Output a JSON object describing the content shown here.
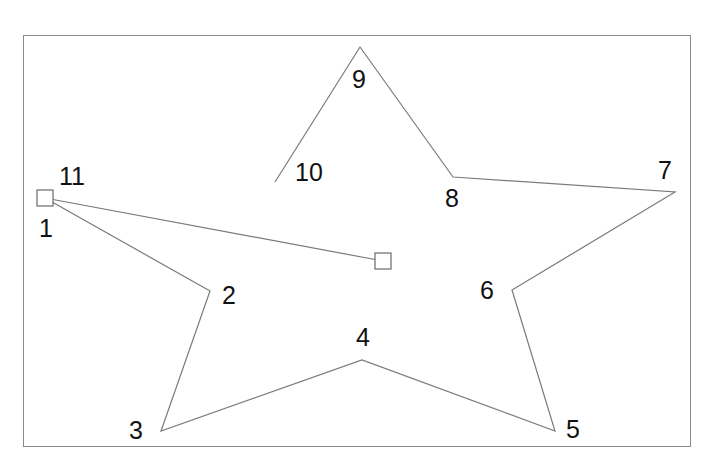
{
  "diagram": {
    "title": "",
    "frame": {
      "x": 23,
      "y": 35,
      "width": 668,
      "height": 412
    },
    "line_color": "#7a7a7a",
    "label_color": "#111111",
    "points": [
      {
        "id": "1",
        "x": 45,
        "y": 198
      },
      {
        "id": "2",
        "x": 210,
        "y": 291
      },
      {
        "id": "3",
        "x": 161,
        "y": 431
      },
      {
        "id": "4",
        "x": 362,
        "y": 360
      },
      {
        "id": "5",
        "x": 555,
        "y": 431
      },
      {
        "id": "6",
        "x": 512,
        "y": 290
      },
      {
        "id": "7",
        "x": 675,
        "y": 192
      },
      {
        "id": "8",
        "x": 453,
        "y": 177
      },
      {
        "id": "9",
        "x": 360,
        "y": 47
      },
      {
        "id": "10",
        "x": 275,
        "y": 182
      }
    ],
    "polyline": [
      [
        45,
        198
      ],
      [
        210,
        291
      ],
      [
        161,
        431
      ],
      [
        362,
        360
      ],
      [
        555,
        431
      ],
      [
        512,
        290
      ],
      [
        675,
        192
      ],
      [
        453,
        177
      ],
      [
        360,
        47
      ],
      [
        275,
        182
      ]
    ],
    "handle_line": {
      "from": [
        45,
        198
      ],
      "to": [
        383,
        261
      ]
    },
    "handles": [
      {
        "name": "start-handle",
        "x": 45,
        "y": 198,
        "size": 16
      },
      {
        "name": "end-handle",
        "x": 383,
        "y": 261,
        "size": 16
      }
    ],
    "labels": [
      {
        "text": "1",
        "x": 39,
        "y": 216
      },
      {
        "text": "2",
        "x": 222,
        "y": 283
      },
      {
        "text": "3",
        "x": 129,
        "y": 418
      },
      {
        "text": "4",
        "x": 356,
        "y": 325
      },
      {
        "text": "5",
        "x": 566,
        "y": 417
      },
      {
        "text": "6",
        "x": 480,
        "y": 278
      },
      {
        "text": "7",
        "x": 658,
        "y": 158
      },
      {
        "text": "8",
        "x": 445,
        "y": 186
      },
      {
        "text": "9",
        "x": 352,
        "y": 67
      },
      {
        "text": "10",
        "x": 295,
        "y": 160
      },
      {
        "text": "11",
        "x": 59,
        "y": 164
      }
    ]
  }
}
